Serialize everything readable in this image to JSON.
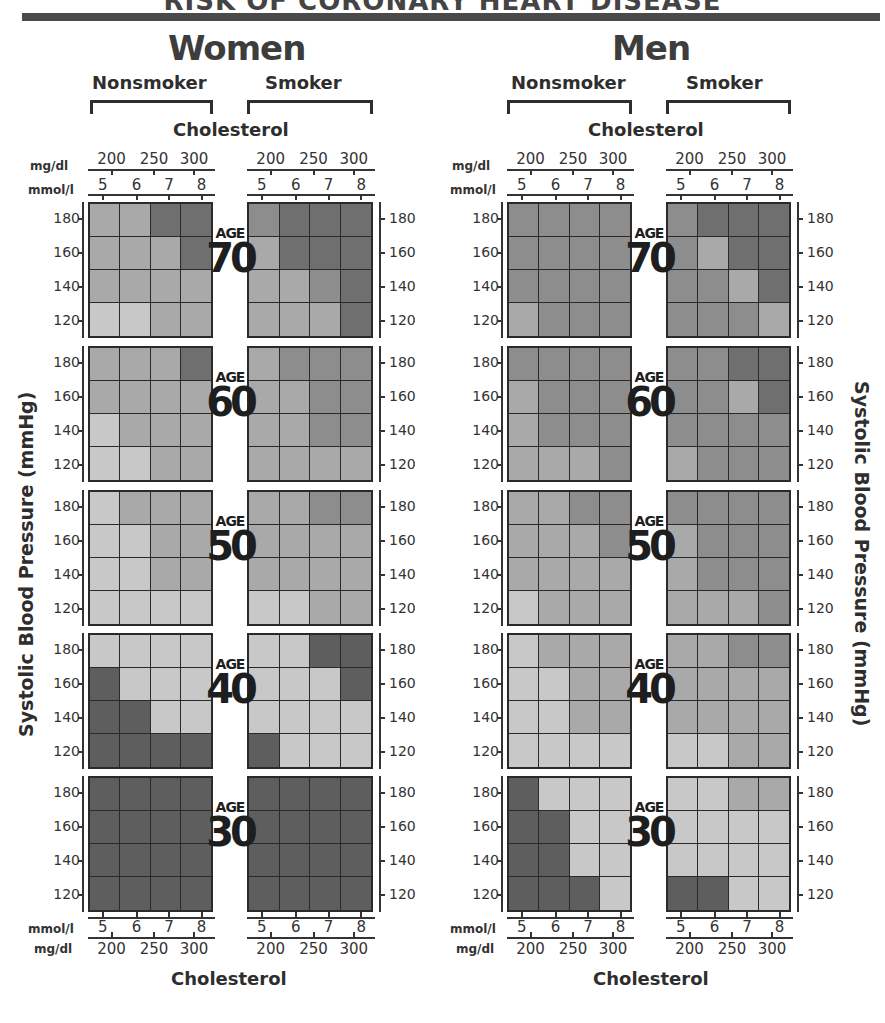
{
  "title": "RISK OF CORONARY HEART DISEASE",
  "panels": [
    {
      "gender": "Women",
      "groups": [
        "Nonsmoker",
        "Smoker"
      ]
    },
    {
      "gender": "Men",
      "groups": [
        "Nonsmoker",
        "Smoker"
      ]
    }
  ],
  "axes": {
    "cholesterol_label": "Cholesterol",
    "mgdl_unit": "mg/dl",
    "mmol_unit": "mmol/l",
    "mgdl_ticks": [
      "200",
      "250",
      "300"
    ],
    "mmol_ticks": [
      "5",
      "6",
      "7",
      "8"
    ],
    "sbp_label": "Systolic Blood Pressure (mmHg)",
    "sbp_ticks": [
      "180",
      "160",
      "140",
      "120"
    ],
    "age_word": "AGE"
  },
  "shade_colors": {
    "0": "#c8c8c8",
    "1": "#a9a9a9",
    "2": "#8d8d8d",
    "3": "#6f6f6f",
    "4": "#575757",
    "nd": "#5e5e5e"
  },
  "chart_data": {
    "type": "heatmap",
    "title": "Risk of Coronary Heart Disease",
    "xlabel": "Cholesterol (mmol/l: 5,6,7,8; mg/dl: 200,250,300)",
    "ylabel": "Systolic Blood Pressure (mmHg)",
    "x": [
      "5",
      "6",
      "7",
      "8"
    ],
    "y": [
      "180",
      "160",
      "140",
      "120"
    ],
    "ages": [
      "70",
      "60",
      "50",
      "40",
      "30"
    ],
    "legend_note": "shade levels 0 (lightest, lowest risk) to 4 (darkest, highest risk); 'nd' = uniform dark fill",
    "series": [
      {
        "name": "Women Nonsmoker",
        "values": {
          "70": [
            [
              1,
              1,
              3,
              3
            ],
            [
              1,
              1,
              1,
              3
            ],
            [
              1,
              1,
              1,
              1
            ],
            [
              0,
              0,
              1,
              1
            ]
          ],
          "60": [
            [
              1,
              1,
              1,
              3
            ],
            [
              1,
              1,
              1,
              1
            ],
            [
              0,
              1,
              1,
              1
            ],
            [
              0,
              0,
              1,
              1
            ]
          ],
          "50": [
            [
              0,
              1,
              1,
              1
            ],
            [
              0,
              0,
              1,
              1
            ],
            [
              0,
              0,
              1,
              1
            ],
            [
              0,
              0,
              0,
              0
            ]
          ],
          "40": [
            [
              0,
              0,
              0,
              0
            ],
            [
              "nd",
              0,
              0,
              0
            ],
            [
              "nd",
              "nd",
              0,
              0
            ],
            [
              "nd",
              "nd",
              "nd",
              "nd"
            ]
          ],
          "30": [
            [
              "nd",
              "nd",
              "nd",
              "nd"
            ],
            [
              "nd",
              "nd",
              "nd",
              "nd"
            ],
            [
              "nd",
              "nd",
              "nd",
              "nd"
            ],
            [
              "nd",
              "nd",
              "nd",
              "nd"
            ]
          ]
        }
      },
      {
        "name": "Women Smoker",
        "values": {
          "70": [
            [
              2,
              3,
              3,
              3
            ],
            [
              1,
              3,
              3,
              3
            ],
            [
              1,
              1,
              2,
              3
            ],
            [
              1,
              1,
              1,
              3
            ]
          ],
          "60": [
            [
              1,
              2,
              2,
              2
            ],
            [
              1,
              1,
              2,
              2
            ],
            [
              1,
              1,
              2,
              2
            ],
            [
              1,
              1,
              1,
              1
            ]
          ],
          "50": [
            [
              1,
              1,
              2,
              2
            ],
            [
              1,
              1,
              1,
              1
            ],
            [
              1,
              1,
              1,
              1
            ],
            [
              0,
              0,
              1,
              1
            ]
          ],
          "40": [
            [
              0,
              0,
              "nd",
              "nd"
            ],
            [
              0,
              0,
              0,
              "nd"
            ],
            [
              0,
              0,
              0,
              0
            ],
            [
              "nd",
              0,
              0,
              0
            ]
          ],
          "30": [
            [
              "nd",
              "nd",
              "nd",
              "nd"
            ],
            [
              "nd",
              "nd",
              "nd",
              "nd"
            ],
            [
              "nd",
              "nd",
              "nd",
              "nd"
            ],
            [
              "nd",
              "nd",
              "nd",
              "nd"
            ]
          ]
        }
      },
      {
        "name": "Men Nonsmoker",
        "values": {
          "70": [
            [
              2,
              2,
              2,
              2
            ],
            [
              2,
              2,
              2,
              2
            ],
            [
              2,
              2,
              2,
              2
            ],
            [
              1,
              2,
              2,
              2
            ]
          ],
          "60": [
            [
              2,
              2,
              2,
              2
            ],
            [
              1,
              2,
              2,
              2
            ],
            [
              1,
              2,
              2,
              2
            ],
            [
              1,
              1,
              1,
              2
            ]
          ],
          "50": [
            [
              1,
              1,
              2,
              2
            ],
            [
              1,
              1,
              1,
              2
            ],
            [
              1,
              1,
              1,
              1
            ],
            [
              0,
              1,
              1,
              1
            ]
          ],
          "40": [
            [
              0,
              1,
              1,
              1
            ],
            [
              0,
              0,
              1,
              1
            ],
            [
              0,
              0,
              1,
              1
            ],
            [
              0,
              0,
              0,
              0
            ]
          ],
          "30": [
            [
              "nd",
              0,
              0,
              0
            ],
            [
              "nd",
              "nd",
              0,
              0
            ],
            [
              "nd",
              "nd",
              0,
              0
            ],
            [
              "nd",
              "nd",
              "nd",
              0
            ]
          ]
        }
      },
      {
        "name": "Men Smoker",
        "values": {
          "70": [
            [
              2,
              3,
              3,
              3
            ],
            [
              2,
              1,
              3,
              3
            ],
            [
              2,
              2,
              1,
              3
            ],
            [
              2,
              2,
              2,
              1
            ]
          ],
          "60": [
            [
              2,
              2,
              3,
              3
            ],
            [
              2,
              2,
              1,
              3
            ],
            [
              2,
              2,
              2,
              2
            ],
            [
              1,
              2,
              2,
              2
            ]
          ],
          "50": [
            [
              2,
              2,
              2,
              2
            ],
            [
              1,
              2,
              2,
              2
            ],
            [
              1,
              2,
              2,
              2
            ],
            [
              1,
              1,
              1,
              2
            ]
          ],
          "40": [
            [
              1,
              1,
              2,
              2
            ],
            [
              1,
              1,
              1,
              1
            ],
            [
              1,
              1,
              1,
              1
            ],
            [
              0,
              0,
              1,
              1
            ]
          ],
          "30": [
            [
              0,
              0,
              1,
              1
            ],
            [
              0,
              0,
              0,
              0
            ],
            [
              0,
              0,
              0,
              0
            ],
            [
              "nd",
              "nd",
              0,
              0
            ]
          ]
        }
      }
    ]
  }
}
